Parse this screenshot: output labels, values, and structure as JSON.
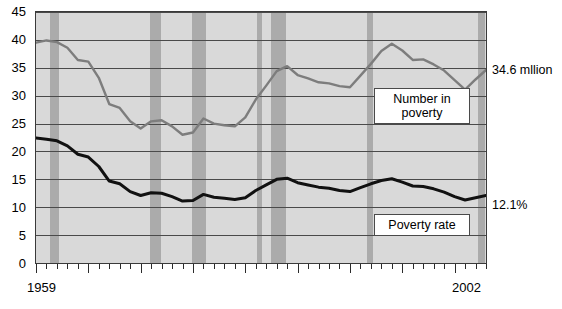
{
  "chart_data": {
    "type": "line",
    "title": "",
    "subtitle": "",
    "xlabel": "",
    "ylabel": "",
    "xlim": [
      1959,
      2002
    ],
    "ylim": [
      0,
      45
    ],
    "grid": true,
    "legend_position": "inline-callouts",
    "y_ticks": [
      "0",
      "5",
      "10",
      "15",
      "20",
      "25",
      "30",
      "35",
      "40",
      "45"
    ],
    "x_ticks": [
      "1959",
      "2002"
    ],
    "x_tick_interval_minor": 1,
    "x_tick_interval_major": 5,
    "x": [
      1959,
      1960,
      1961,
      1962,
      1963,
      1964,
      1965,
      1966,
      1967,
      1968,
      1969,
      1970,
      1971,
      1972,
      1973,
      1974,
      1975,
      1976,
      1977,
      1978,
      1979,
      1980,
      1981,
      1982,
      1983,
      1984,
      1985,
      1986,
      1987,
      1988,
      1989,
      1990,
      1991,
      1992,
      1993,
      1994,
      1995,
      1996,
      1997,
      1998,
      1999,
      2000,
      2001,
      2002
    ],
    "series": [
      {
        "name": "Number in poverty",
        "units": "millions",
        "color": "#7d7d7d",
        "values": [
          39.5,
          39.9,
          39.6,
          38.6,
          36.4,
          36.1,
          33.2,
          28.5,
          27.8,
          25.4,
          24.1,
          25.4,
          25.6,
          24.5,
          23.0,
          23.4,
          25.9,
          25.0,
          24.7,
          24.5,
          26.1,
          29.3,
          31.8,
          34.4,
          35.3,
          33.7,
          33.1,
          32.4,
          32.2,
          31.7,
          31.5,
          33.6,
          35.7,
          38.0,
          39.3,
          38.1,
          36.4,
          36.5,
          35.6,
          34.5,
          32.8,
          31.1,
          32.9,
          34.6
        ]
      },
      {
        "name": "Poverty rate",
        "units": "percent",
        "color": "#111111",
        "values": [
          22.4,
          22.2,
          21.9,
          21.0,
          19.5,
          19.0,
          17.3,
          14.7,
          14.2,
          12.8,
          12.1,
          12.6,
          12.5,
          11.9,
          11.1,
          11.2,
          12.3,
          11.8,
          11.6,
          11.4,
          11.7,
          13.0,
          14.0,
          15.0,
          15.2,
          14.4,
          14.0,
          13.6,
          13.4,
          13.0,
          12.8,
          13.5,
          14.2,
          14.8,
          15.1,
          14.5,
          13.8,
          13.7,
          13.3,
          12.7,
          11.9,
          11.3,
          11.7,
          12.1
        ]
      }
    ],
    "recession_bands": [
      {
        "start": 1960.3,
        "end": 1961.2
      },
      {
        "start": 1969.9,
        "end": 1970.9
      },
      {
        "start": 1973.9,
        "end": 1975.2
      },
      {
        "start": 1980.1,
        "end": 1980.6
      },
      {
        "start": 1981.5,
        "end": 1982.9
      },
      {
        "start": 1990.6,
        "end": 1991.2
      },
      {
        "start": 2001.2,
        "end": 2001.9
      }
    ],
    "annotations": [
      {
        "id": "number-in-poverty-callout",
        "text": "Number in\npoverty"
      },
      {
        "id": "poverty-rate-callout",
        "text": "Poverty rate"
      },
      {
        "id": "number-in-poverty-endvalue",
        "text": "34.6 mllion"
      },
      {
        "id": "poverty-rate-endvalue",
        "text": "12.1%"
      }
    ],
    "colors": {
      "plot_background": "#d9d9d9",
      "recession_band": "#ababab",
      "gridline": "#4a4a4a",
      "axis": "#3a3a3a",
      "number_line": "#7d7d7d",
      "rate_line": "#111111",
      "callout_background": "#ffffff",
      "text": "#000000"
    }
  }
}
